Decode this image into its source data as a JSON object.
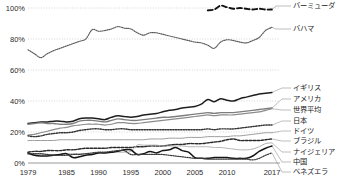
{
  "chart_data": {
    "type": "line",
    "title": "",
    "subtitle": "",
    "xlabel": "",
    "ylabel": "",
    "xlim": [
      1979,
      2017
    ],
    "ylim": [
      0,
      100
    ],
    "grid": true,
    "legend_position": "right-inline-labels",
    "y_ticks": [
      "0%",
      "20%",
      "40%",
      "60%",
      "80%",
      "100%"
    ],
    "y_tick_values": [
      0,
      20,
      40,
      60,
      80,
      100
    ],
    "x_ticks": [
      "1979",
      "1985",
      "1990",
      "1995",
      "2000",
      "2005",
      "2010",
      "2017"
    ],
    "x_tick_values": [
      1979,
      1985,
      1990,
      1995,
      2000,
      2005,
      2010,
      2017
    ],
    "x": [
      1979,
      1980,
      1981,
      1982,
      1983,
      1984,
      1985,
      1986,
      1987,
      1988,
      1989,
      1990,
      1991,
      1992,
      1993,
      1994,
      1995,
      1996,
      1997,
      1998,
      1999,
      2000,
      2001,
      2002,
      2003,
      2004,
      2005,
      2006,
      2007,
      2008,
      2009,
      2010,
      2011,
      2012,
      2013,
      2014,
      2015,
      2016,
      2017
    ],
    "series": [
      {
        "name": "バーミューダ",
        "color": "#111111",
        "style": "dashed",
        "width": 1.9,
        "label_y": 6,
        "x": [
          2007,
          2008,
          2009,
          2010,
          2011,
          2012,
          2013,
          2014,
          2015,
          2016,
          2017
        ],
        "values": [
          98.5,
          99.0,
          101.5,
          100.5,
          99.5,
          100.0,
          99.5,
          99.0,
          99.5,
          99.0,
          99.0
        ]
      },
      {
        "name": "バハマ",
        "color": "#5a5a5a",
        "style": "dotted",
        "width": 1.15,
        "label_y": 29,
        "values": [
          73.0,
          70.5,
          68.0,
          70.5,
          72.5,
          74.0,
          75.5,
          77.0,
          78.5,
          80.0,
          86.0,
          85.0,
          85.5,
          86.5,
          88.0,
          87.0,
          86.5,
          84.0,
          82.5,
          84.0,
          84.0,
          83.0,
          82.0,
          81.0,
          80.0,
          79.0,
          78.0,
          77.5,
          76.0,
          74.0,
          78.0,
          79.5,
          79.0,
          78.0,
          77.5,
          79.0,
          81.0,
          85.5,
          87.5
        ]
      },
      {
        "name": "イギリス",
        "color": "#1e1e1e",
        "style": "solid",
        "width": 1.5,
        "label_y": 88,
        "values": [
          25.5,
          26.0,
          26.5,
          26.5,
          27.0,
          27.0,
          26.5,
          27.0,
          28.5,
          29.0,
          29.0,
          28.5,
          28.0,
          29.5,
          30.5,
          30.0,
          29.5,
          30.0,
          31.0,
          31.5,
          32.0,
          33.0,
          34.0,
          34.5,
          35.5,
          36.0,
          36.5,
          38.0,
          41.0,
          39.5,
          41.5,
          40.5,
          40.0,
          41.5,
          42.5,
          43.5,
          44.5,
          45.0,
          45.5
        ]
      },
      {
        "name": "アメリカ",
        "color": "#7d7d7d",
        "style": "solid",
        "width": 1.35,
        "label_y": 99,
        "values": [
          25.0,
          25.5,
          26.0,
          25.5,
          25.5,
          25.0,
          25.0,
          25.5,
          27.0,
          27.5,
          27.5,
          27.0,
          26.5,
          27.5,
          28.5,
          28.0,
          27.5,
          27.5,
          28.0,
          28.5,
          29.0,
          29.5,
          29.5,
          30.0,
          30.5,
          31.0,
          31.5,
          32.0,
          32.5,
          32.0,
          32.5,
          32.5,
          32.5,
          33.0,
          33.5,
          34.0,
          34.5,
          35.0,
          35.5
        ]
      },
      {
        "name": "世界平均",
        "color": "#8c8c8c",
        "style": "solid",
        "width": 1.2,
        "label_y": 110,
        "values": [
          18.0,
          18.5,
          19.5,
          20.5,
          21.5,
          22.5,
          23.0,
          24.0,
          24.5,
          25.0,
          25.0,
          25.0,
          24.5,
          25.0,
          26.0,
          26.0,
          25.5,
          25.5,
          26.0,
          26.5,
          27.0,
          27.5,
          28.0,
          28.5,
          29.0,
          29.5,
          30.0,
          30.5,
          31.0,
          30.5,
          31.0,
          31.0,
          31.0,
          31.5,
          32.0,
          32.5,
          33.0,
          34.0,
          35.0
        ]
      },
      {
        "name": "日本",
        "color": "#333333",
        "style": "dotted",
        "width": 1.4,
        "label_y": 121,
        "values": [
          17.5,
          17.0,
          17.5,
          18.5,
          19.0,
          19.5,
          19.5,
          20.0,
          21.0,
          21.5,
          22.0,
          22.0,
          21.5,
          21.5,
          22.0,
          22.0,
          21.5,
          21.5,
          21.5,
          21.5,
          21.5,
          21.5,
          21.5,
          21.5,
          21.5,
          21.5,
          21.5,
          21.5,
          22.0,
          21.5,
          22.0,
          22.0,
          22.0,
          22.5,
          23.0,
          23.5,
          24.0,
          24.5,
          24.5
        ]
      },
      {
        "name": "ドイツ",
        "color": "#9e9e9e",
        "style": "solid",
        "width": 1.0,
        "label_y": 131,
        "values": [
          14.5,
          14.5,
          14.5,
          14.5,
          14.5,
          15.0,
          15.0,
          15.0,
          15.0,
          15.0,
          15.0,
          15.0,
          15.0,
          15.0,
          15.0,
          15.0,
          15.0,
          15.0,
          15.0,
          15.5,
          15.5,
          15.5,
          16.0,
          16.0,
          16.0,
          16.5,
          16.5,
          16.5,
          17.0,
          17.0,
          17.0,
          17.0,
          17.5,
          17.5,
          18.0,
          18.5,
          19.0,
          19.5,
          19.5
        ]
      },
      {
        "name": "ブラジル",
        "color": "#2a2a2a",
        "style": "dashed-dot",
        "width": 1.45,
        "label_y": 141,
        "values": [
          7.0,
          7.5,
          7.5,
          8.0,
          8.0,
          8.0,
          8.5,
          8.5,
          9.0,
          9.5,
          9.5,
          9.5,
          9.5,
          10.0,
          10.0,
          10.0,
          10.0,
          10.5,
          10.5,
          11.0,
          11.0,
          11.0,
          11.5,
          12.0,
          12.0,
          12.5,
          12.5,
          12.5,
          13.0,
          13.5,
          14.0,
          15.0,
          15.5,
          14.5,
          14.5,
          14.5,
          14.5,
          15.0,
          15.5
        ]
      },
      {
        "name": "ナイジェリア",
        "color": "#a8a8a8",
        "style": "dotted",
        "width": 1.0,
        "label_y": 152,
        "values": [
          5.5,
          5.5,
          5.5,
          5.5,
          5.5,
          5.5,
          6.0,
          6.0,
          6.0,
          6.0,
          6.0,
          6.5,
          6.5,
          7.0,
          7.0,
          7.0,
          7.5,
          11.5,
          11.5,
          11.5,
          11.5,
          11.0,
          11.0,
          11.0,
          11.0,
          10.5,
          10.5,
          10.5,
          10.5,
          10.0,
          10.0,
          9.5,
          9.0,
          8.5,
          8.5,
          9.0,
          10.5,
          12.5,
          13.0
        ]
      },
      {
        "name": "中国",
        "color": "#151515",
        "style": "solid",
        "width": 1.5,
        "label_y": 162,
        "values": [
          6.5,
          5.0,
          4.5,
          4.5,
          5.0,
          5.5,
          6.0,
          3.5,
          4.0,
          5.0,
          5.5,
          6.5,
          6.5,
          7.0,
          7.5,
          8.5,
          8.5,
          5.5,
          6.0,
          7.5,
          6.5,
          8.0,
          8.5,
          10.0,
          8.0,
          7.0,
          3.5,
          3.0,
          3.0,
          3.5,
          3.5,
          3.5,
          3.0,
          3.0,
          3.0,
          4.5,
          7.5,
          9.5,
          11.0
        ]
      },
      {
        "name": "ベネズエラ",
        "color": "#3c3c3c",
        "style": "dotted",
        "width": 1.25,
        "label_y": 172,
        "values": [
          6.0,
          6.0,
          6.0,
          5.5,
          5.0,
          5.0,
          5.0,
          5.5,
          5.5,
          6.0,
          6.5,
          7.0,
          7.0,
          7.5,
          8.0,
          8.0,
          5.5,
          5.5,
          5.5,
          5.5,
          5.5,
          5.5,
          5.0,
          4.5,
          4.0,
          3.5,
          3.0,
          3.0,
          2.5,
          2.5,
          2.5,
          2.5,
          2.5,
          2.5,
          2.5,
          2.0,
          3.0,
          5.0,
          6.5
        ]
      }
    ]
  }
}
